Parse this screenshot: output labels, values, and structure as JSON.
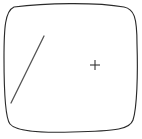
{
  "figure": {
    "canvas": {
      "width": 142,
      "height": 139,
      "background_color": "#ffffff"
    },
    "shapes": [
      {
        "name": "rounded-square-outline",
        "kind": "closed-path",
        "description": "Hand-drawn rounded square (squircle) border",
        "stroke_color": "#2b2b2b",
        "stroke_width": 1.15,
        "fill_color": "#ffffff",
        "path": "M 14 7 C 45 3, 96 2, 124 7 C 134 9, 137 17, 137 44 C 138 74, 137 108, 133 120 C 130 129, 118 131, 72 132 C 36 133, 16 131, 10 124 C 5 118, 4 92, 4 58 C 4 28, 5 11, 14 7 Z",
        "bounds": {
          "left": 4,
          "top": 3,
          "right": 138,
          "bottom": 133
        }
      },
      {
        "name": "diagonal-line",
        "kind": "line",
        "description": "Diagonal stroke in the upper-left interior, running lower-left to upper-right",
        "stroke_color": "#555555",
        "stroke_width": 1.3,
        "x1": 11,
        "y1": 103,
        "x2": 44,
        "y2": 36
      },
      {
        "name": "cross-marker",
        "kind": "plus",
        "description": "Small plus / crosshair marker at right-center",
        "stroke_color": "#333333",
        "stroke_width": 1.1,
        "center_x": 95,
        "center_y": 65,
        "arm_length": 5
      }
    ]
  }
}
